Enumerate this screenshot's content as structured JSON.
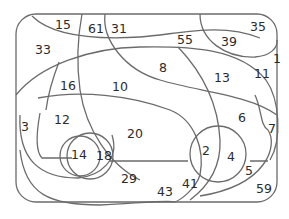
{
  "diagram": {
    "type": "region-number-puzzle",
    "line_color": "#6b6b6b",
    "text_color": "#2b2b2b",
    "regions": [
      {
        "label": "15",
        "x": 63,
        "y": 25
      },
      {
        "label": "61",
        "x": 96,
        "y": 29
      },
      {
        "label": "31",
        "x": 119,
        "y": 29
      },
      {
        "label": "55",
        "x": 185,
        "y": 40
      },
      {
        "label": "39",
        "x": 229,
        "y": 42
      },
      {
        "label": "35",
        "x": 258,
        "y": 27
      },
      {
        "label": "1",
        "x": 277,
        "y": 59
      },
      {
        "label": "33",
        "x": 43,
        "y": 50
      },
      {
        "label": "8",
        "x": 163,
        "y": 68
      },
      {
        "label": "13",
        "x": 222,
        "y": 78
      },
      {
        "label": "11",
        "x": 262,
        "y": 74
      },
      {
        "label": "16",
        "x": 68,
        "y": 86
      },
      {
        "label": "10",
        "x": 120,
        "y": 87
      },
      {
        "label": "6",
        "x": 242,
        "y": 118
      },
      {
        "label": "7",
        "x": 272,
        "y": 129
      },
      {
        "label": "3",
        "x": 25,
        "y": 127
      },
      {
        "label": "12",
        "x": 62,
        "y": 120
      },
      {
        "label": "20",
        "x": 135,
        "y": 134
      },
      {
        "label": "2",
        "x": 206,
        "y": 151
      },
      {
        "label": "4",
        "x": 231,
        "y": 157
      },
      {
        "label": "14",
        "x": 79,
        "y": 155
      },
      {
        "label": "18",
        "x": 104,
        "y": 156
      },
      {
        "label": "5",
        "x": 249,
        "y": 171
      },
      {
        "label": "29",
        "x": 129,
        "y": 179
      },
      {
        "label": "41",
        "x": 190,
        "y": 184
      },
      {
        "label": "43",
        "x": 165,
        "y": 192
      },
      {
        "label": "59",
        "x": 264,
        "y": 189
      }
    ]
  }
}
